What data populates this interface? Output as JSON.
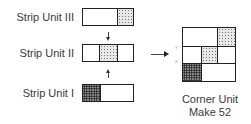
{
  "strips": [
    {
      "label": "Strip Unit III",
      "cells": [
        "plain",
        "plain",
        "light"
      ]
    },
    {
      "label": "Strip Unit II",
      "cells": [
        "plain",
        "light",
        "plain"
      ]
    },
    {
      "label": "Strip Unit I",
      "cells": [
        "dark",
        "plain",
        "plain"
      ]
    }
  ],
  "corner_unit": {
    "title": "Corner Unit",
    "subtitle": "Make 52",
    "marks": [
      "Y",
      "X"
    ]
  },
  "colors": {
    "outline": "#222222",
    "text": "#3a3a3a"
  }
}
